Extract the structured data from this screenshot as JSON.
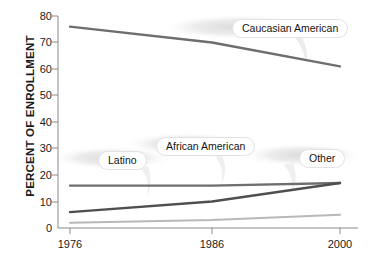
{
  "chart_data": {
    "type": "line",
    "title": "",
    "xlabel": "",
    "ylabel": "PERCENT OF ENROLLMENT",
    "categories": [
      "1976",
      "1986",
      "2000"
    ],
    "x_ticks": [
      "1976",
      "1986",
      "2000"
    ],
    "y_ticks": [
      "0",
      "10",
      "20",
      "30",
      "40",
      "50",
      "60",
      "70",
      "80"
    ],
    "ylim": [
      0,
      80
    ],
    "grid": false,
    "legend": "inline-callout-labels",
    "series": [
      {
        "name": "Caucasian American",
        "values": [
          76,
          70,
          61
        ],
        "color": "#6e6e6e"
      },
      {
        "name": "African American",
        "values": [
          16,
          16,
          17
        ],
        "color": "#6e6e6e"
      },
      {
        "name": "Latino",
        "values": [
          6,
          10,
          17
        ],
        "color": "#4f4f4f"
      },
      {
        "name": "Other",
        "values": [
          2,
          3,
          5
        ],
        "color": "#b8b8b8"
      }
    ],
    "annotations": [
      {
        "label": "Caucasian American",
        "x": 240,
        "y": 20
      },
      {
        "label": "African American",
        "x": 160,
        "y": 137
      },
      {
        "label": "Latino",
        "x": 96,
        "y": 151
      },
      {
        "label": "Other",
        "x": 300,
        "y": 149
      }
    ]
  },
  "axis": {
    "y_title": "PERCENT OF ENROLLMENT",
    "y_ticks": [
      "80",
      "70",
      "60",
      "50",
      "40",
      "30",
      "20",
      "10",
      "0"
    ],
    "x_ticks": [
      "1976",
      "1986",
      "2000"
    ]
  },
  "colors": {
    "axis": "#8a8a8a",
    "text": "#1b1b1b",
    "caucasian": "#6e6e6e",
    "african_american": "#6e6e6e",
    "latino": "#4f4f4f",
    "other": "#b8b8b8",
    "bubble_shadow": "#e9e9e9"
  }
}
